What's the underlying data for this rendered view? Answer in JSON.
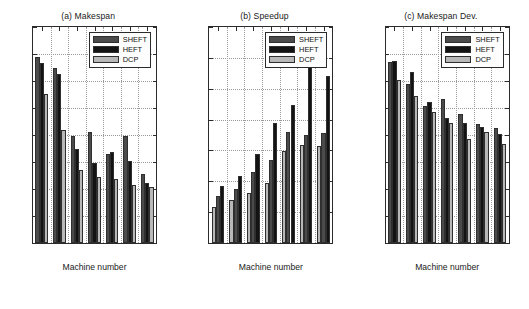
{
  "figure": {
    "width": 529,
    "height": 309,
    "background": "#ffffff"
  },
  "series_colors": {
    "SHEFT": "#4b4b4b",
    "HEFT": "#131313",
    "DCP": "#b8b8b8"
  },
  "legend": {
    "position": "top-right-inside",
    "entries": [
      {
        "label": "SHEFT",
        "color": "#4b4b4b",
        "swatch": "sheft-swatch"
      },
      {
        "label": "HEFT",
        "color": "#131313",
        "swatch": "heft-swatch"
      },
      {
        "label": "DCP",
        "color": "#b8b8b8",
        "swatch": "dcp-swatch"
      }
    ]
  },
  "chart_data": [
    {
      "id": "makespan",
      "type": "bar",
      "title": "(a) Makespan",
      "xlabel": "Machine number",
      "ylabel": "",
      "categories": [
        "4",
        "6",
        "8",
        "10",
        "12",
        "14",
        "16"
      ],
      "xticks": [
        4,
        6,
        8,
        10,
        12,
        14,
        16
      ],
      "ylim": [
        0,
        400
      ],
      "yticks": [
        0,
        50,
        100,
        150,
        200,
        250,
        300,
        350,
        400
      ],
      "ytick_labels": [
        "0",
        "50",
        "100",
        "150",
        "200",
        "250",
        "300",
        "350",
        "400"
      ],
      "grid": true,
      "bar_order": [
        "SHEFT",
        "HEFT",
        "DCP"
      ],
      "series": [
        {
          "name": "SHEFT",
          "color": "#4b4b4b",
          "values": [
            345,
            324,
            199,
            206,
            165,
            199,
            128
          ]
        },
        {
          "name": "HEFT",
          "color": "#131313",
          "values": [
            333,
            313,
            175,
            149,
            168,
            152,
            111
          ]
        },
        {
          "name": "DCP",
          "color": "#b8b8b8",
          "values": [
            276,
            209,
            135,
            123,
            119,
            108,
            103
          ]
        }
      ]
    },
    {
      "id": "speedup",
      "type": "bar",
      "title": "(b) Speedup",
      "xlabel": "Machine number",
      "ylabel": "",
      "categories": [
        "4",
        "6",
        "8",
        "10",
        "12",
        "14",
        "16"
      ],
      "xticks": [
        4,
        6,
        8,
        10,
        12,
        14,
        16
      ],
      "ylim": [
        0,
        7
      ],
      "yticks": [
        0,
        1,
        2,
        3,
        4,
        5,
        6,
        7
      ],
      "ytick_labels": [
        "0",
        "1",
        "2",
        "3",
        "4",
        "5",
        "6",
        "7"
      ],
      "grid": true,
      "bar_order": [
        "DCP",
        "SHEFT",
        "HEFT"
      ],
      "series": [
        {
          "name": "DCP",
          "color": "#b8b8b8",
          "values": [
            1.16,
            1.41,
            1.62,
            1.95,
            2.98,
            3.18,
            3.16
          ]
        },
        {
          "name": "SHEFT",
          "color": "#4b4b4b",
          "values": [
            1.52,
            1.76,
            2.3,
            2.69,
            3.61,
            3.51,
            3.57
          ]
        },
        {
          "name": "HEFT",
          "color": "#131313",
          "values": [
            1.84,
            2.17,
            2.88,
            3.9,
            4.48,
            5.73,
            5.42
          ]
        }
      ]
    },
    {
      "id": "makespan-dev",
      "type": "bar",
      "title": "(c) Makespan Dev.",
      "xlabel": "Machine number",
      "ylabel": "",
      "categories": [
        "4",
        "6",
        "8",
        "10",
        "12",
        "14",
        "16"
      ],
      "xticks": [
        4,
        6,
        8,
        10,
        12,
        14,
        16
      ],
      "ylim": [
        0,
        40
      ],
      "yticks": [
        0,
        5,
        10,
        15,
        20,
        25,
        30,
        35,
        40
      ],
      "ytick_labels": [
        "0",
        "5",
        "10",
        "15",
        "20",
        "25",
        "30",
        "35",
        "40"
      ],
      "grid": true,
      "bar_order": [
        "SHEFT",
        "HEFT",
        "DCP"
      ],
      "series": [
        {
          "name": "SHEFT",
          "color": "#4b4b4b",
          "values": [
            33.6,
            29.5,
            25.4,
            26.6,
            23.9,
            22.1,
            21.3
          ]
        },
        {
          "name": "HEFT",
          "color": "#131313",
          "values": [
            33.7,
            31.7,
            26.1,
            23.2,
            22.2,
            21.5,
            20.1
          ]
        },
        {
          "name": "DCP",
          "color": "#b8b8b8",
          "values": [
            30.1,
            27.3,
            24.2,
            22.3,
            19.2,
            20.5,
            18.4
          ]
        }
      ]
    }
  ]
}
